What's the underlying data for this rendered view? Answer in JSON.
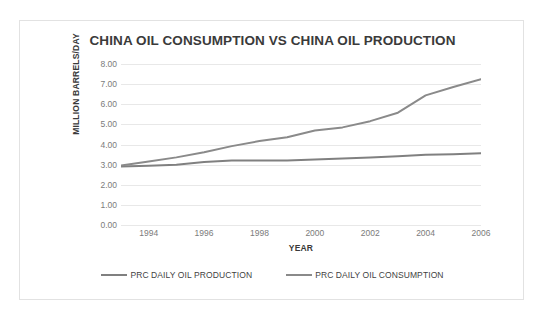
{
  "chart_data": {
    "type": "line",
    "title": "CHINA OIL CONSUMPTION VS CHINA OIL PRODUCTION",
    "xlabel": "YEAR",
    "ylabel": "MILLION BARRELS/DAY",
    "x": [
      1993,
      1994,
      1995,
      1996,
      1997,
      1998,
      1999,
      2000,
      2001,
      2002,
      2003,
      2004,
      2005,
      2006
    ],
    "xlim": [
      1993,
      2006
    ],
    "ylim": [
      0.0,
      8.0
    ],
    "x_tick_labels": [
      "1994",
      "1996",
      "1998",
      "2000",
      "2002",
      "2004",
      "2006"
    ],
    "x_tick_values": [
      1994,
      1996,
      1998,
      2000,
      2002,
      2004,
      2006
    ],
    "y_tick_labels": [
      "0.00",
      "1.00",
      "2.00",
      "3.00",
      "4.00",
      "5.00",
      "6.00",
      "7.00",
      "8.00"
    ],
    "y_tick_values": [
      0,
      1,
      2,
      3,
      4,
      5,
      6,
      7,
      8
    ],
    "grid": true,
    "legend_position": "bottom",
    "series": [
      {
        "name": "PRC DAILY OIL PRODUCTION",
        "color": "#808080",
        "values": [
          2.91,
          2.94,
          2.99,
          3.13,
          3.2,
          3.21,
          3.21,
          3.25,
          3.3,
          3.35,
          3.41,
          3.49,
          3.52,
          3.57
        ]
      },
      {
        "name": "PRC DAILY OIL CONSUMPTION",
        "color": "#8a8a8a",
        "values": [
          2.96,
          3.16,
          3.36,
          3.61,
          3.92,
          4.17,
          4.36,
          4.7,
          4.85,
          5.16,
          5.58,
          6.44,
          6.86,
          7.24
        ]
      }
    ]
  },
  "legend": {
    "items": [
      {
        "label": "PRC DAILY OIL PRODUCTION"
      },
      {
        "label": "PRC DAILY OIL CONSUMPTION"
      }
    ]
  }
}
